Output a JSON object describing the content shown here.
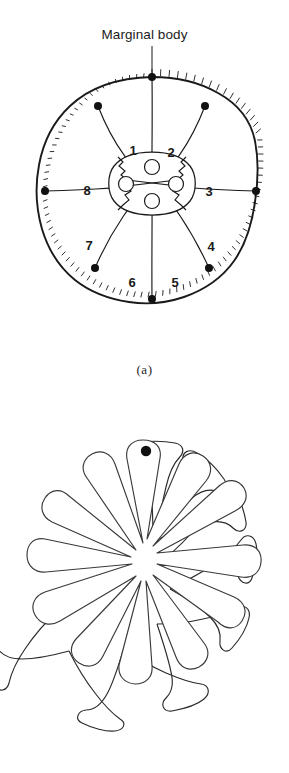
{
  "figure": {
    "background_color": "#ffffff",
    "ink_color": "#1a1a1a",
    "annotation": {
      "label": "Marginal body",
      "pointer": "leader-line-to-rim-dot"
    },
    "panels": [
      {
        "id": "a",
        "caption": "(a)",
        "view": "expanded-radial-view",
        "description": "Circular organism in expanded state with ciliated margin, eight radial partitions, eight marginal bodies on the rim, and a central rosette of four nucleated cells.",
        "sectors": [
          {
            "number": "1",
            "cx": 133,
            "cy": 155
          },
          {
            "number": "2",
            "cx": 171,
            "cy": 157
          },
          {
            "number": "3",
            "cx": 209,
            "cy": 196
          },
          {
            "number": "4",
            "cx": 211,
            "cy": 251
          },
          {
            "number": "5",
            "cx": 175,
            "cy": 287
          },
          {
            "number": "6",
            "cx": 132,
            "cy": 287
          },
          {
            "number": "7",
            "cx": 89,
            "cy": 250
          },
          {
            "number": "8",
            "cx": 87,
            "cy": 195
          }
        ],
        "marginal_body_count": 8,
        "marginal_body_color": "#111111",
        "central_cells": 4,
        "central_nuclei": 4,
        "margin_texture": "cilia-bristles"
      },
      {
        "id": "b",
        "caption": "(b)",
        "view": "contracted-lobed-view",
        "description": "Same organism contracted into eight rounded lobes separated by deep narrow clefts, with a single marginal body visible at the top lobe.",
        "lobe_count": 8,
        "marginal_body_count": 1,
        "marginal_body_color": "#111111"
      }
    ]
  }
}
